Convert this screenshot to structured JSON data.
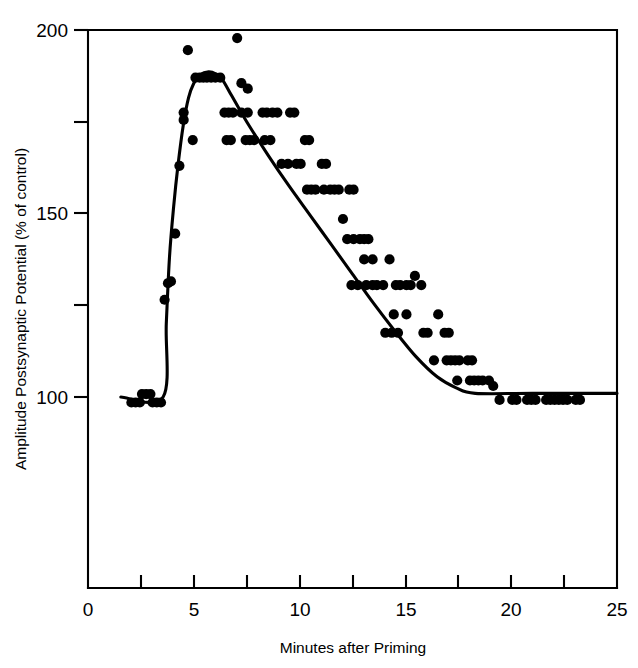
{
  "chart_data": {
    "type": "scatter",
    "title": "",
    "subtitle": "",
    "xlabel": "Minutes after Priming",
    "ylabel": "Amplitude Postsynaptic Potential (% of control)",
    "xlim": [
      0,
      25
    ],
    "ylim": [
      100,
      200
    ],
    "y_axis_note": "y-axis lower bound drawn is the plot frame bottom; 100 gridline sits above the frame base",
    "grid": false,
    "legend": null,
    "x_ticks_major": [
      0,
      5,
      10,
      15,
      20,
      25
    ],
    "x_tick_labels": [
      "0",
      "5",
      "10",
      "15",
      "20",
      "25"
    ],
    "x_ticks_minor": [
      2.5,
      7.5,
      12.5,
      17.5,
      22.5
    ],
    "y_ticks_major": [
      100,
      150,
      200
    ],
    "y_tick_labels": [
      "100",
      "150",
      "200"
    ],
    "y_ticks_minor": [
      125,
      175
    ],
    "marker": "filled-circle",
    "marker_color": "#000000",
    "line_color": "#000000",
    "series": [
      {
        "name": "Postsynaptic potential amplitude",
        "points": [
          [
            2.05,
            98.5
          ],
          [
            2.25,
            98.5
          ],
          [
            2.45,
            98.5
          ],
          [
            2.55,
            100.8
          ],
          [
            2.75,
            100.8
          ],
          [
            2.95,
            100.8
          ],
          [
            3.05,
            98.5
          ],
          [
            3.25,
            98.5
          ],
          [
            3.45,
            98.5
          ],
          [
            3.62,
            126.5
          ],
          [
            3.78,
            131.0
          ],
          [
            3.92,
            131.5
          ],
          [
            4.12,
            144.5
          ],
          [
            4.32,
            163.0
          ],
          [
            4.52,
            175.5
          ],
          [
            4.52,
            177.5
          ],
          [
            4.72,
            194.5
          ],
          [
            4.95,
            170.0
          ],
          [
            5.08,
            187.0
          ],
          [
            5.28,
            187.0
          ],
          [
            5.45,
            187.0
          ],
          [
            5.62,
            187.0
          ],
          [
            5.82,
            187.0
          ],
          [
            6.02,
            187.0
          ],
          [
            6.25,
            187.0
          ],
          [
            6.45,
            177.5
          ],
          [
            6.65,
            177.5
          ],
          [
            6.85,
            177.5
          ],
          [
            6.55,
            170.0
          ],
          [
            6.75,
            170.0
          ],
          [
            7.05,
            197.8
          ],
          [
            7.25,
            185.5
          ],
          [
            7.55,
            184.0
          ],
          [
            7.25,
            177.5
          ],
          [
            7.55,
            177.5
          ],
          [
            7.45,
            170.0
          ],
          [
            7.65,
            170.0
          ],
          [
            7.85,
            170.0
          ],
          [
            8.25,
            177.5
          ],
          [
            8.45,
            177.5
          ],
          [
            8.72,
            177.5
          ],
          [
            8.95,
            177.5
          ],
          [
            8.35,
            170.0
          ],
          [
            8.62,
            170.0
          ],
          [
            9.15,
            163.5
          ],
          [
            9.55,
            177.5
          ],
          [
            9.75,
            177.5
          ],
          [
            9.45,
            163.5
          ],
          [
            9.85,
            163.5
          ],
          [
            10.05,
            163.5
          ],
          [
            10.25,
            170.0
          ],
          [
            10.45,
            170.0
          ],
          [
            10.35,
            156.5
          ],
          [
            10.55,
            156.5
          ],
          [
            10.75,
            156.5
          ],
          [
            11.05,
            163.5
          ],
          [
            11.25,
            163.5
          ],
          [
            11.15,
            156.5
          ],
          [
            11.45,
            156.5
          ],
          [
            11.65,
            156.5
          ],
          [
            11.85,
            156.5
          ],
          [
            12.05,
            148.5
          ],
          [
            12.35,
            156.5
          ],
          [
            12.55,
            156.5
          ],
          [
            12.25,
            143.0
          ],
          [
            12.55,
            143.0
          ],
          [
            12.85,
            143.0
          ],
          [
            13.05,
            143.0
          ],
          [
            13.25,
            143.0
          ],
          [
            13.05,
            137.5
          ],
          [
            13.45,
            137.5
          ],
          [
            12.45,
            130.5
          ],
          [
            12.75,
            130.5
          ],
          [
            13.15,
            130.5
          ],
          [
            13.45,
            130.5
          ],
          [
            13.65,
            130.5
          ],
          [
            13.95,
            130.5
          ],
          [
            14.25,
            137.5
          ],
          [
            14.55,
            130.5
          ],
          [
            14.75,
            130.5
          ],
          [
            15.05,
            130.5
          ],
          [
            15.25,
            130.5
          ],
          [
            15.45,
            133.0
          ],
          [
            15.75,
            130.5
          ],
          [
            14.45,
            122.5
          ],
          [
            15.05,
            122.5
          ],
          [
            14.05,
            117.5
          ],
          [
            14.35,
            117.5
          ],
          [
            14.65,
            117.5
          ],
          [
            15.85,
            117.5
          ],
          [
            16.05,
            117.5
          ],
          [
            16.55,
            122.5
          ],
          [
            16.85,
            117.5
          ],
          [
            17.05,
            117.5
          ],
          [
            16.35,
            110.0
          ],
          [
            16.95,
            110.0
          ],
          [
            17.15,
            110.0
          ],
          [
            17.35,
            110.0
          ],
          [
            17.55,
            110.0
          ],
          [
            17.95,
            110.0
          ],
          [
            18.15,
            110.0
          ],
          [
            17.45,
            104.5
          ],
          [
            18.05,
            104.5
          ],
          [
            18.25,
            104.5
          ],
          [
            18.45,
            104.5
          ],
          [
            18.65,
            104.5
          ],
          [
            18.95,
            104.5
          ],
          [
            19.15,
            103.0
          ],
          [
            19.45,
            99.2
          ],
          [
            20.05,
            99.2
          ],
          [
            20.25,
            99.2
          ],
          [
            20.75,
            99.2
          ],
          [
            20.95,
            99.2
          ],
          [
            21.15,
            99.2
          ],
          [
            21.65,
            99.2
          ],
          [
            21.85,
            99.2
          ],
          [
            22.05,
            99.2
          ],
          [
            22.25,
            99.2
          ],
          [
            22.45,
            99.2
          ],
          [
            22.65,
            99.2
          ],
          [
            23.05,
            99.2
          ],
          [
            23.25,
            99.2
          ]
        ]
      }
    ],
    "fit_curve": {
      "name": "fitted time-course",
      "description": "flat baseline at 100 until 3.6 min, steep rise to a rounded peak of 188 near 5.7 min, linear decay to 101 at 18.3 min, flat at 101 through 25 min",
      "points": [
        [
          1.55,
          100.0
        ],
        [
          3.55,
          100.0
        ],
        [
          3.7,
          120.0
        ],
        [
          3.85,
          138.0
        ],
        [
          4.05,
          152.0
        ],
        [
          4.25,
          163.0
        ],
        [
          4.5,
          174.0
        ],
        [
          4.75,
          181.5
        ],
        [
          5.0,
          185.5
        ],
        [
          5.3,
          187.8
        ],
        [
          5.7,
          188.6
        ],
        [
          6.05,
          188.0
        ],
        [
          6.35,
          186.5
        ],
        [
          6.8,
          182.0
        ],
        [
          7.5,
          175.0
        ],
        [
          8.5,
          166.0
        ],
        [
          9.5,
          157.5
        ],
        [
          10.5,
          149.5
        ],
        [
          11.5,
          141.5
        ],
        [
          12.5,
          133.5
        ],
        [
          13.5,
          125.5
        ],
        [
          14.5,
          118.0
        ],
        [
          15.5,
          111.0
        ],
        [
          16.5,
          105.5
        ],
        [
          17.4,
          102.5
        ],
        [
          18.3,
          101.0
        ],
        [
          21.0,
          101.0
        ],
        [
          25.0,
          101.0
        ]
      ]
    }
  },
  "axes": {
    "y_label": "Amplitude Postsynaptic Potential (% of control)",
    "x_label": "Minutes after Priming",
    "x_tick_labels": [
      "0",
      "5",
      "10",
      "15",
      "20",
      "25"
    ],
    "y_tick_labels": [
      "200",
      "150",
      "100"
    ]
  }
}
